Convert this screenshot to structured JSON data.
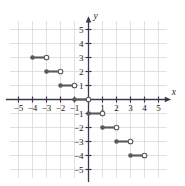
{
  "chart_data": {
    "type": "line",
    "title": "",
    "xlabel": "x",
    "ylabel": "y",
    "xlim": [
      -5.8,
      5.8
    ],
    "ylim": [
      -5.8,
      5.8
    ],
    "grid": true,
    "legend": null,
    "x_ticks": [
      -5,
      -4,
      -3,
      -2,
      -1,
      1,
      2,
      3,
      4,
      5
    ],
    "y_ticks": [
      -5,
      -4,
      -3,
      -2,
      -1,
      1,
      2,
      3,
      4,
      5
    ],
    "x_tick_labels": [
      "−5",
      "−4",
      "−3",
      "−2",
      "−1",
      "1",
      "2",
      "3",
      "4",
      "5"
    ],
    "y_tick_labels": [
      "−5",
      "−4",
      "−3",
      "−2",
      "−1",
      "1",
      "2",
      "3",
      "4",
      "5"
    ],
    "series": [
      {
        "name": "step-function",
        "style": "step-segments",
        "color": "#595959",
        "segments": [
          {
            "x_start": -4,
            "x_end": -3,
            "y": 3,
            "left_endpoint": "closed",
            "right_endpoint": "open"
          },
          {
            "x_start": -3,
            "x_end": -2,
            "y": 2,
            "left_endpoint": "closed",
            "right_endpoint": "open"
          },
          {
            "x_start": -2,
            "x_end": -1,
            "y": 1,
            "left_endpoint": "closed",
            "right_endpoint": "open"
          },
          {
            "x_start": -1,
            "x_end": 0,
            "y": 0,
            "left_endpoint": "closed",
            "right_endpoint": "open"
          },
          {
            "x_start": 0,
            "x_end": 1,
            "y": -1,
            "left_endpoint": "closed",
            "right_endpoint": "open"
          },
          {
            "x_start": 1,
            "x_end": 2,
            "y": -2,
            "left_endpoint": "closed",
            "right_endpoint": "open"
          },
          {
            "x_start": 2,
            "x_end": 3,
            "y": -3,
            "left_endpoint": "closed",
            "right_endpoint": "open"
          },
          {
            "x_start": 3,
            "x_end": 4,
            "y": -4,
            "left_endpoint": "closed",
            "right_endpoint": "open"
          }
        ]
      }
    ],
    "colors": {
      "axis": "#3b3b4d",
      "grid": "#d8d8e0",
      "data": "#595959",
      "open_marker_fill": "#ffffff",
      "text": "#1a1a1a",
      "background": "#ffffff"
    }
  }
}
